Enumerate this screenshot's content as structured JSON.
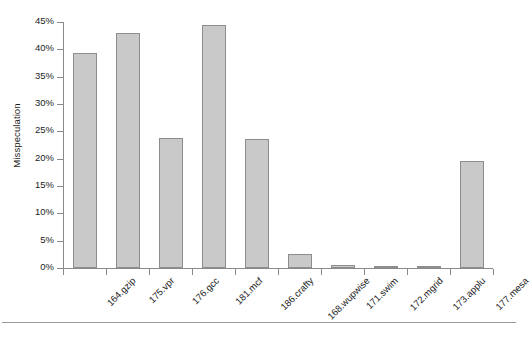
{
  "chart_data": {
    "type": "bar",
    "title": "",
    "xlabel": "",
    "ylabel": "Misspeculation",
    "categories": [
      "164.gzip",
      "175.vpr",
      "176.gcc",
      "181.mcf",
      "186.crafty",
      "168.wupwise",
      "171.swim",
      "172.mgrid",
      "173.applu",
      "177.mesa"
    ],
    "values": [
      39.3,
      43.0,
      23.8,
      44.5,
      23.6,
      2.5,
      0.6,
      0.4,
      0.2,
      19.6
    ],
    "value_unit": "%",
    "ylim": [
      0,
      45
    ],
    "ytick_values": [
      0,
      5,
      10,
      15,
      20,
      25,
      30,
      35,
      40,
      45
    ],
    "ytick_labels": [
      "0%",
      "5%",
      "10%",
      "15%",
      "20%",
      "25%",
      "30%",
      "35%",
      "40%",
      "45%"
    ],
    "grid": false,
    "legend": null,
    "bar_color": "#c9c9c9",
    "bar_border_color": "#8d8d8d",
    "axis_color": "#8a8a8a"
  }
}
